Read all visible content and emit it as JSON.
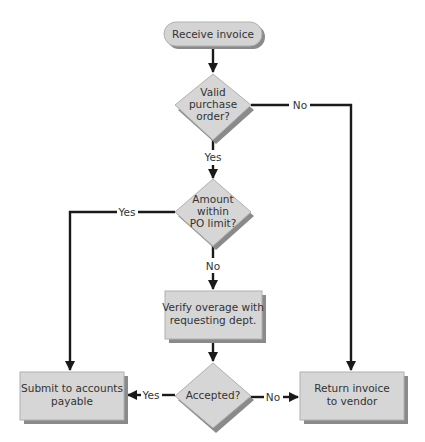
{
  "diagram": {
    "type": "flowchart",
    "colors": {
      "shape_fill": "#d8d8d8",
      "shape_shadow": "#8a8a8a",
      "shape_stroke": "#b0b0b0",
      "line": "#1a1a1a",
      "text": "#333333"
    },
    "nodes": {
      "start": {
        "shape": "rounded-rect",
        "lines": [
          "Receive invoice"
        ]
      },
      "valid_po": {
        "shape": "diamond",
        "lines": [
          "Valid",
          "purchase",
          "order?"
        ]
      },
      "within_limit": {
        "shape": "diamond",
        "lines": [
          "Amount",
          "within",
          "PO limit?"
        ]
      },
      "verify": {
        "shape": "rect",
        "lines": [
          "Verify overage with",
          "requesting dept."
        ]
      },
      "accepted": {
        "shape": "diamond",
        "lines": [
          "Accepted?"
        ]
      },
      "submit": {
        "shape": "rect",
        "lines": [
          "Submit to accounts",
          "payable"
        ]
      },
      "return": {
        "shape": "rect",
        "lines": [
          "Return invoice",
          "to vendor"
        ]
      }
    },
    "edges": {
      "e1": {
        "from": "start",
        "to": "valid_po",
        "label": ""
      },
      "e2": {
        "from": "valid_po",
        "to": "within_limit",
        "label": "Yes"
      },
      "e3": {
        "from": "valid_po",
        "to": "return",
        "label": "No"
      },
      "e4": {
        "from": "within_limit",
        "to": "submit",
        "label": "Yes"
      },
      "e5": {
        "from": "within_limit",
        "to": "verify",
        "label": "No"
      },
      "e6": {
        "from": "verify",
        "to": "accepted",
        "label": ""
      },
      "e7": {
        "from": "accepted",
        "to": "submit",
        "label": "Yes"
      },
      "e8": {
        "from": "accepted",
        "to": "return",
        "label": "No"
      }
    }
  }
}
